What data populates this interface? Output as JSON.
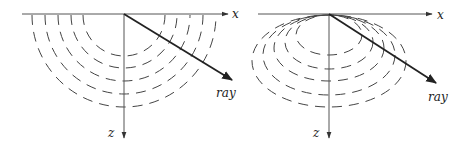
{
  "figure": {
    "panels": [
      {
        "id": "left",
        "description": "isotropic wavefronts (concentric semicircles)",
        "origin": [
          124,
          14
        ],
        "x_axis": {
          "label": "x",
          "from": 22,
          "to": 228
        },
        "z_axis": {
          "label": "z",
          "to": 138
        },
        "ray": {
          "label": "ray",
          "end": [
            232,
            80
          ]
        },
        "wavefront_radii": [
          41,
          53,
          66,
          79,
          92
        ]
      },
      {
        "id": "right",
        "description": "anisotropic wavefronts (ellipses tangent at origin)",
        "origin": [
          329,
          14
        ],
        "x_axis": {
          "label": "x",
          "from": 258,
          "to": 432
        },
        "z_axis": {
          "label": "z",
          "to": 138
        },
        "ray": {
          "label": "ray",
          "end": [
            436,
            83
          ]
        },
        "wavefront_ellipses": [
          {
            "rx": 33,
            "ry": 20
          },
          {
            "rx": 44,
            "ry": 27
          },
          {
            "rx": 55,
            "ry": 33
          },
          {
            "rx": 66,
            "ry": 40
          },
          {
            "rx": 77,
            "ry": 46
          }
        ]
      }
    ],
    "labels": {
      "left_x": "x",
      "left_z": "z",
      "left_ray": "ray",
      "right_x": "x",
      "right_z": "z",
      "right_ray": "ray"
    }
  }
}
